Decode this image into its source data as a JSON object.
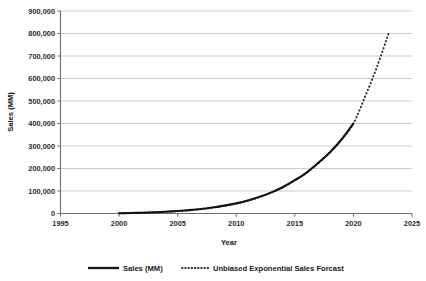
{
  "chart_data": {
    "type": "line",
    "title": "",
    "xlabel": "Year",
    "ylabel": "Sales (MM)",
    "xlim": [
      1995,
      2025
    ],
    "ylim": [
      0,
      900000
    ],
    "grid": true,
    "legend_position": "bottom",
    "y_ticks": [
      0,
      100000,
      200000,
      300000,
      400000,
      500000,
      600000,
      700000,
      800000,
      900000
    ],
    "y_tick_labels": [
      "0",
      "100,000",
      "200,000",
      "300,000",
      "400,000",
      "500,000",
      "600,000",
      "700,000",
      "800,000",
      "900,000"
    ],
    "x_ticks": [
      1995,
      2000,
      2005,
      2010,
      2015,
      2020,
      2025
    ],
    "x_tick_labels": [
      "1995",
      "2000",
      "2005",
      "2010",
      "2015",
      "2020",
      "2025"
    ],
    "series": [
      {
        "name": "Sales (MM)",
        "style": "solid",
        "color": "#141414",
        "x": [
          2000,
          2001,
          2002,
          2003,
          2004,
          2005,
          2006,
          2007,
          2008,
          2009,
          2010,
          2011,
          2012,
          2013,
          2014,
          2015,
          2016,
          2017,
          2018,
          2019,
          2020
        ],
        "values": [
          1000,
          2000,
          3500,
          5500,
          8000,
          11000,
          15000,
          20000,
          27000,
          35000,
          45000,
          58000,
          74000,
          94000,
          118000,
          148000,
          182000,
          225000,
          272000,
          330000,
          400000
        ]
      },
      {
        "name": "Unbiased Exponential Sales Forcast",
        "style": "dotted",
        "color": "#2e2e2e",
        "x": [
          2000,
          2001,
          2002,
          2003,
          2004,
          2005,
          2006,
          2007,
          2008,
          2009,
          2010,
          2011,
          2012,
          2013,
          2014,
          2015,
          2016,
          2017,
          2018,
          2019,
          2020,
          2021,
          2022,
          2023
        ],
        "values": [
          900,
          1800,
          3200,
          5200,
          7600,
          10500,
          14500,
          19500,
          26500,
          34500,
          44000,
          57000,
          73000,
          93000,
          117000,
          147000,
          181000,
          224000,
          271000,
          329000,
          400000,
          520000,
          650000,
          800000
        ]
      }
    ]
  },
  "legend": {
    "items": [
      {
        "label": "Sales (MM)",
        "style": "solid"
      },
      {
        "label": "Unbiased Exponential Sales Forcast",
        "style": "dotted"
      }
    ]
  }
}
